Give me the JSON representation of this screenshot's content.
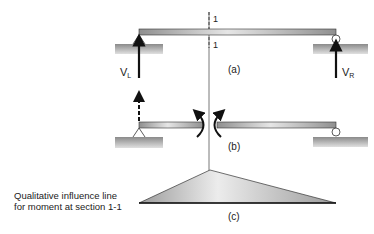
{
  "figure": {
    "section_label_top": "1",
    "section_label_bottom": "1",
    "part_a": {
      "label": "(a)",
      "left_reaction": "V",
      "left_reaction_sub": "L",
      "right_reaction": "V",
      "right_reaction_sub": "R"
    },
    "part_b": {
      "label": "(b)"
    },
    "part_c": {
      "label": "(c)",
      "caption_line1": "Qualitative influence line",
      "caption_line2": "for moment at section 1-1"
    },
    "colors": {
      "beam": "#b5b5b5",
      "ground": "#9a9a9a",
      "stroke": "#111111",
      "influence_fill": "#c8c8c8"
    }
  }
}
